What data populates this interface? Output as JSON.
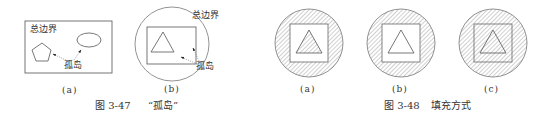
{
  "figures": [
    {
      "id": "fig-3-47",
      "caption_number": "图 3-47",
      "caption_title": "“孤岛”",
      "panels": [
        {
          "sublabel": "(a)",
          "outer_boundary_label": "总边界",
          "island_label": "孤岛",
          "shapes": [
            "rectangle-boundary",
            "pentagon",
            "ellipse"
          ]
        },
        {
          "sublabel": "(b)",
          "outer_boundary_label": "总边界",
          "island_label": "孤岛",
          "shapes": [
            "circle-boundary",
            "square",
            "triangle"
          ]
        }
      ]
    },
    {
      "id": "fig-3-48",
      "caption_number": "图 3-48",
      "caption_title": "填充方式",
      "panels": [
        {
          "sublabel": "(a)",
          "fill_mode": "normal",
          "hatched_regions": [
            "ring",
            "triangle"
          ]
        },
        {
          "sublabel": "(b)",
          "fill_mode": "outer",
          "hatched_regions": [
            "ring"
          ]
        },
        {
          "sublabel": "(c)",
          "fill_mode": "ignore",
          "hatched_regions": [
            "circle-all"
          ]
        }
      ]
    }
  ],
  "colors": {
    "line": "#555555",
    "hatch": "#8a8a8a",
    "text": "#333333",
    "background": "#ffffff"
  }
}
